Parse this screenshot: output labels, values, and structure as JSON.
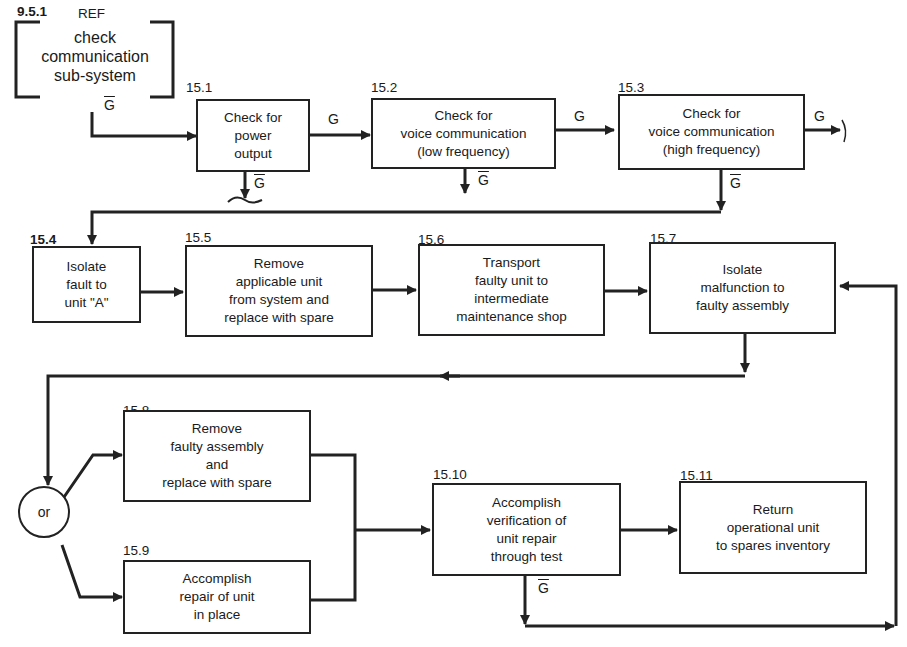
{
  "reference": {
    "number": "9.5.1",
    "tag": "REF",
    "text": "check\ncommunication\nsub-system"
  },
  "labels": {
    "go": "G",
    "no_go": "G"
  },
  "steps": [
    {
      "id": "15.1",
      "text": "Check for\npower\noutput"
    },
    {
      "id": "15.2",
      "text": "Check for\nvoice communication\n(low frequency)"
    },
    {
      "id": "15.3",
      "text": "Check for\nvoice communication\n(high frequency)"
    },
    {
      "id": "15.4",
      "text": "Isolate\nfault to\nunit \"A\""
    },
    {
      "id": "15.5",
      "text": "Remove\napplicable unit\nfrom system and\nreplace with spare"
    },
    {
      "id": "15.6",
      "text": "Transport\nfaulty unit to\nintermediate\nmaintenance shop"
    },
    {
      "id": "15.7",
      "text": "Isolate\nmalfunction to\nfaulty assembly"
    },
    {
      "id": "15.8",
      "text": "Remove\nfaulty assembly\nand\nreplace with spare"
    },
    {
      "id": "15.9",
      "text": "Accomplish\nrepair of unit\nin place"
    },
    {
      "id": "15.10",
      "text": "Accomplish\nverification of\nunit repair\nthrough test"
    },
    {
      "id": "15.11",
      "text": "Return\noperational unit\nto spares inventory"
    }
  ],
  "or_node": {
    "label": "or"
  }
}
